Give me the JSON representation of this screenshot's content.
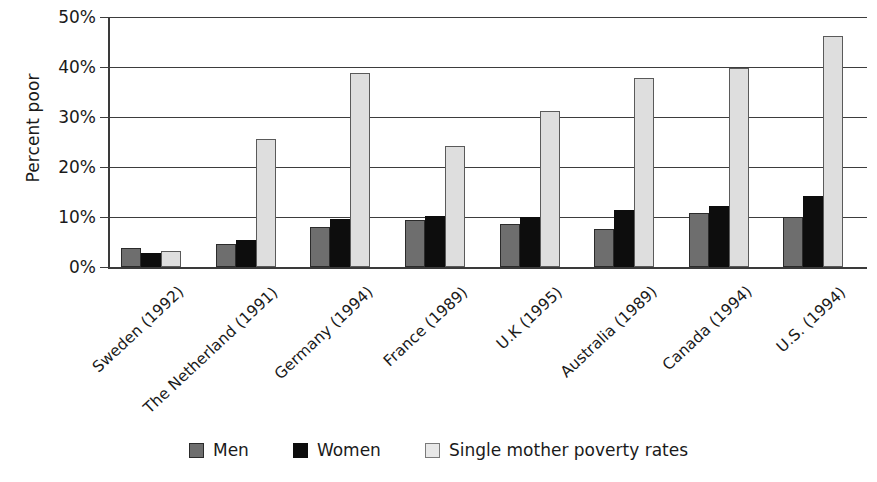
{
  "chart_data": {
    "type": "bar",
    "title": "",
    "subtitle": "",
    "xlabel": "",
    "ylabel": "Percent poor",
    "ylim": [
      0,
      50
    ],
    "ytick_labels": [
      "0%",
      "10%",
      "20%",
      "30%",
      "40%",
      "50%"
    ],
    "ytick_values": [
      0,
      10,
      20,
      30,
      40,
      50
    ],
    "grid": "horizontal",
    "legend_position": "bottom",
    "categories": [
      "Sweden (1992)",
      "The Netherland (1991)",
      "Germany (1994)",
      "France (1989)",
      "U.K (1995)",
      "Australia (1989)",
      "Canada (1994)",
      "U.S. (1994)"
    ],
    "series": [
      {
        "name": "Men",
        "color": "#6e6e6e",
        "values": [
          3.8,
          4.7,
          8.0,
          9.5,
          8.7,
          7.6,
          10.8,
          10.0
        ]
      },
      {
        "name": "Women",
        "color": "#0d0d0d",
        "values": [
          2.8,
          5.4,
          9.6,
          10.3,
          10.0,
          11.4,
          12.3,
          14.2
        ]
      },
      {
        "name": "Single mother poverty rates",
        "color": "#dedede",
        "values": [
          3.2,
          25.6,
          38.8,
          24.2,
          31.3,
          37.9,
          39.8,
          46.3
        ]
      }
    ]
  },
  "axis": {
    "y_title": "Percent poor"
  },
  "legend": {
    "items": [
      {
        "label": "Men",
        "swatch": "men"
      },
      {
        "label": "Women",
        "swatch": "women"
      },
      {
        "label": "Single mother poverty rates",
        "swatch": "single"
      }
    ]
  }
}
